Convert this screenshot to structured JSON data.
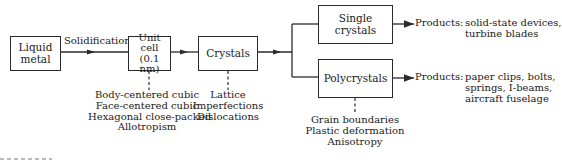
{
  "diagram": {
    "type": "flowchart",
    "nodes": {
      "liquid_metal": {
        "label_line1": "Liquid",
        "label_line2": "metal"
      },
      "unit_cell": {
        "label_line1": "Unit",
        "label_line2": "cell",
        "label_line3": "(0.1 nm)"
      },
      "crystals": {
        "label": "Crystals"
      },
      "single_crystals": {
        "label_line1": "Single",
        "label_line2": "crystals"
      },
      "polycrystals": {
        "label": "Polycrystals"
      }
    },
    "edges": {
      "solidification": {
        "label": "Solidification"
      }
    },
    "annotations": {
      "unit_cell": [
        "Body-centered cubic",
        "Face-centered cubic",
        "Hexagonal close-packed",
        "Allotropism"
      ],
      "crystals": [
        "Lattice",
        "Imperfections",
        "Dislocations"
      ],
      "polycrystals": [
        "Grain boundaries",
        "Plastic deformation",
        "Anisotropy"
      ]
    },
    "products": {
      "single": {
        "prefix": "Products:",
        "line1": "solid-state devices,",
        "line2": "turbine blades"
      },
      "poly": {
        "prefix": "Products:",
        "line1": "paper clips, bolts,",
        "line2": "springs, I-beams,",
        "line3": "aircraft fuselage"
      }
    },
    "colors": {
      "stroke": "#2a2a2a",
      "text": "#1a1a1a",
      "background": "#ffffff"
    }
  }
}
